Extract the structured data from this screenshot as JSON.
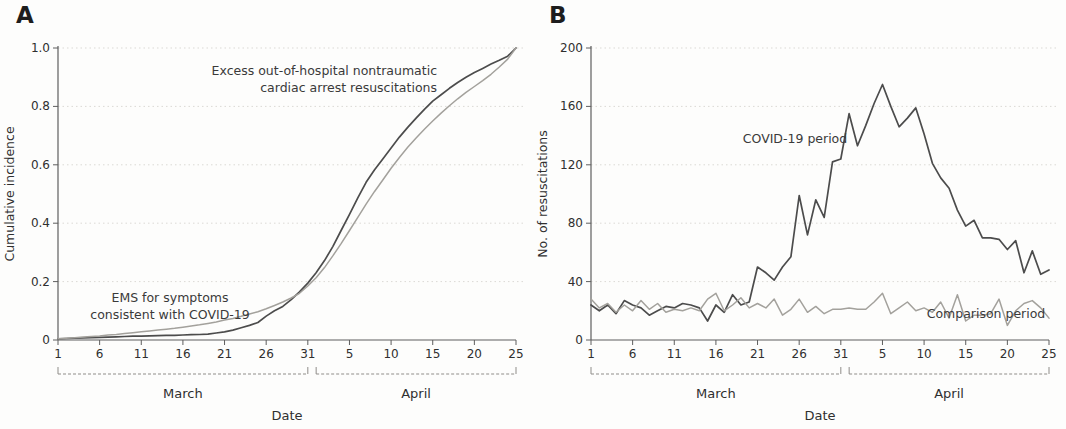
{
  "figure": {
    "background": "#fdfdfc",
    "colors": {
      "dark_line": "#4c4c4c",
      "light_line": "#a3a19c",
      "grid": "#dbd9d5",
      "axis": "#5e5e5e",
      "text": "#2f2f2f",
      "bracket": "#8f8d89"
    }
  },
  "chart_data": [
    {
      "type": "line",
      "panel": "A",
      "ylabel": "Cumulative incidence",
      "xlabel": "Date",
      "ylim": [
        0,
        1.0
      ],
      "yticks": [
        {
          "value": 0,
          "label": "0"
        },
        {
          "value": 0.2,
          "label": "0.2"
        },
        {
          "value": 0.4,
          "label": "0.4"
        },
        {
          "value": 0.6,
          "label": "0.6"
        },
        {
          "value": 0.8,
          "label": "0.8"
        },
        {
          "value": 1.0,
          "label": "1.0"
        }
      ],
      "months": [
        {
          "name": "March",
          "num_days": 31
        },
        {
          "name": "April",
          "num_days": 25
        }
      ],
      "xticks": [
        {
          "label": "1",
          "i": 0
        },
        {
          "label": "6",
          "i": 5
        },
        {
          "label": "11",
          "i": 10
        },
        {
          "label": "16",
          "i": 15
        },
        {
          "label": "21",
          "i": 20
        },
        {
          "label": "26",
          "i": 25
        },
        {
          "label": "31",
          "i": 30
        },
        {
          "label": "5",
          "i": 35
        },
        {
          "label": "10",
          "i": 40
        },
        {
          "label": "15",
          "i": 45
        },
        {
          "label": "20",
          "i": 50
        },
        {
          "label": "25",
          "i": 55
        }
      ],
      "grid": "horizontal-dotted",
      "series": [
        {
          "name": "Excess out-of-hospital nontraumatic cardiac arrest resuscitations",
          "color": "#4c4c4c",
          "width": 1.7,
          "values": [
            0.004,
            0.005,
            0.006,
            0.007,
            0.008,
            0.009,
            0.01,
            0.011,
            0.012,
            0.013,
            0.013,
            0.014,
            0.015,
            0.016,
            0.016,
            0.017,
            0.018,
            0.019,
            0.02,
            0.024,
            0.028,
            0.034,
            0.042,
            0.05,
            0.06,
            0.082,
            0.1,
            0.115,
            0.138,
            0.165,
            0.195,
            0.23,
            0.272,
            0.32,
            0.375,
            0.43,
            0.487,
            0.54,
            0.582,
            0.62,
            0.658,
            0.695,
            0.728,
            0.76,
            0.79,
            0.818,
            0.84,
            0.862,
            0.882,
            0.9,
            0.916,
            0.93,
            0.945,
            0.958,
            0.972,
            1.0
          ]
        },
        {
          "name": "EMS for symptoms consistent with COVID-19",
          "color": "#a3a19c",
          "width": 1.5,
          "values": [
            0.004,
            0.006,
            0.008,
            0.01,
            0.012,
            0.014,
            0.017,
            0.019,
            0.022,
            0.025,
            0.028,
            0.031,
            0.034,
            0.037,
            0.04,
            0.044,
            0.048,
            0.052,
            0.057,
            0.062,
            0.068,
            0.074,
            0.081,
            0.089,
            0.097,
            0.107,
            0.118,
            0.13,
            0.144,
            0.16,
            0.185,
            0.213,
            0.248,
            0.288,
            0.33,
            0.375,
            0.42,
            0.465,
            0.508,
            0.548,
            0.588,
            0.625,
            0.66,
            0.692,
            0.722,
            0.75,
            0.777,
            0.802,
            0.826,
            0.848,
            0.868,
            0.888,
            0.91,
            0.935,
            0.962,
            1.0
          ]
        }
      ],
      "annotations": [
        {
          "lines": [
            "Excess out-of-hospital nontraumatic",
            "cardiac arrest resuscitations"
          ],
          "x": 437,
          "y": 75,
          "anchor": "end",
          "line_height": 17
        },
        {
          "lines": [
            "EMS for symptoms",
            "consistent with COVID-19"
          ],
          "x": 170,
          "y": 302,
          "anchor": "middle",
          "line_height": 17
        }
      ]
    },
    {
      "type": "line",
      "panel": "B",
      "ylabel": "No. of resuscitations",
      "xlabel": "Date",
      "ylim": [
        0,
        200
      ],
      "yticks": [
        {
          "value": 0,
          "label": "0"
        },
        {
          "value": 40,
          "label": "40"
        },
        {
          "value": 80,
          "label": "80"
        },
        {
          "value": 120,
          "label": "120"
        },
        {
          "value": 160,
          "label": "160"
        },
        {
          "value": 200,
          "label": "200"
        }
      ],
      "months": [
        {
          "name": "March",
          "num_days": 31
        },
        {
          "name": "April",
          "num_days": 25
        }
      ],
      "xticks": [
        {
          "label": "1",
          "i": 0
        },
        {
          "label": "6",
          "i": 5
        },
        {
          "label": "11",
          "i": 10
        },
        {
          "label": "16",
          "i": 15
        },
        {
          "label": "21",
          "i": 20
        },
        {
          "label": "26",
          "i": 25
        },
        {
          "label": "31",
          "i": 30
        },
        {
          "label": "5",
          "i": 35
        },
        {
          "label": "10",
          "i": 40
        },
        {
          "label": "15",
          "i": 45
        },
        {
          "label": "20",
          "i": 50
        },
        {
          "label": "25",
          "i": 55
        }
      ],
      "grid": "horizontal-dotted",
      "series": [
        {
          "name": "COVID-19 period",
          "color": "#4c4c4c",
          "width": 1.7,
          "values": [
            24,
            20,
            24,
            18,
            27,
            24,
            22,
            17,
            20,
            23,
            22,
            25,
            24,
            22,
            13,
            24,
            19,
            31,
            24,
            26,
            50,
            46,
            41,
            50,
            57,
            99,
            72,
            96,
            84,
            122,
            124,
            155,
            133,
            147,
            162,
            175,
            160,
            146,
            152,
            159,
            141,
            121,
            111,
            104,
            89,
            78,
            82,
            70,
            70,
            69,
            62,
            68,
            46,
            61,
            45,
            48
          ]
        },
        {
          "name": "Comparison period",
          "color": "#a3a19c",
          "width": 1.5,
          "values": [
            28,
            22,
            25,
            19,
            24,
            20,
            27,
            21,
            25,
            19,
            21,
            20,
            22,
            20,
            28,
            32,
            20,
            24,
            29,
            22,
            25,
            22,
            28,
            17,
            21,
            28,
            19,
            23,
            18,
            21,
            21,
            22,
            21,
            21,
            26,
            32,
            18,
            22,
            26,
            20,
            22,
            19,
            26,
            15,
            31,
            13,
            17,
            17,
            18,
            28,
            10,
            20,
            25,
            27,
            22,
            15
          ]
        }
      ],
      "annotations": [
        {
          "lines": [
            "COVID-19 period"
          ],
          "x": 262,
          "y": 143,
          "anchor": "middle",
          "line_height": 17
        },
        {
          "lines": [
            "Comparison period"
          ],
          "x": 453,
          "y": 318,
          "anchor": "middle",
          "line_height": 17
        }
      ]
    }
  ]
}
